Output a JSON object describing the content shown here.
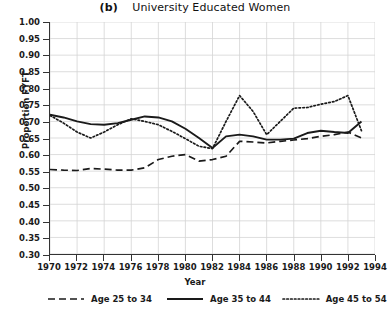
{
  "chart_data": {
    "type": "line",
    "panel_tag": "(b)",
    "title_text": "University Educated Women",
    "xlabel": "Year",
    "ylabel": "Proportion FYFT",
    "grid": true,
    "legend_position": "bottom",
    "xlim": [
      1970,
      1994
    ],
    "ylim": [
      0.3,
      1.0
    ],
    "ytick_labels": [
      "1.00",
      "0.95",
      "0.90",
      "0.85",
      "0.80",
      "0.75",
      "0.70",
      "0.65",
      "0.60",
      "0.55",
      "0.50",
      "0.45",
      "0.40",
      "0.35",
      "0.30"
    ],
    "ytick_values": [
      1.0,
      0.95,
      0.9,
      0.85,
      0.8,
      0.75,
      0.7,
      0.65,
      0.6,
      0.55,
      0.5,
      0.45,
      0.4,
      0.35,
      0.3
    ],
    "xtick_labels": [
      "1970",
      "1972",
      "1974",
      "1976",
      "1978",
      "1980",
      "1982",
      "1984",
      "1986",
      "1988",
      "1990",
      "1992",
      "1994"
    ],
    "xtick_values": [
      1970,
      1972,
      1974,
      1976,
      1978,
      1980,
      1982,
      1984,
      1986,
      1988,
      1990,
      1992,
      1994
    ],
    "x": [
      1970,
      1971,
      1972,
      1973,
      1974,
      1975,
      1976,
      1977,
      1978,
      1979,
      1980,
      1981,
      1982,
      1983,
      1984,
      1985,
      1986,
      1987,
      1988,
      1989,
      1990,
      1991,
      1992,
      1993
    ],
    "series": [
      {
        "name": "Age 25 to 34",
        "style": "dashed",
        "color": "#1a1a1a",
        "values": [
          0.555,
          0.553,
          0.552,
          0.558,
          0.556,
          0.553,
          0.553,
          0.56,
          0.585,
          0.595,
          0.6,
          0.58,
          0.585,
          0.595,
          0.64,
          0.638,
          0.635,
          0.64,
          0.644,
          0.648,
          0.655,
          0.66,
          0.668,
          0.65
        ]
      },
      {
        "name": "Age 35 to 44",
        "style": "solid",
        "color": "#1a1a1a",
        "values": [
          0.72,
          0.712,
          0.7,
          0.692,
          0.69,
          0.695,
          0.705,
          0.715,
          0.712,
          0.7,
          0.678,
          0.65,
          0.62,
          0.655,
          0.66,
          0.655,
          0.645,
          0.645,
          0.648,
          0.665,
          0.672,
          0.668,
          0.665,
          0.7
        ]
      },
      {
        "name": "Age 45 to 54",
        "style": "dotted",
        "color": "#1a1a1a",
        "values": [
          0.718,
          0.695,
          0.668,
          0.65,
          0.668,
          0.69,
          0.708,
          0.7,
          0.69,
          0.67,
          0.648,
          0.625,
          0.618,
          0.7,
          0.778,
          0.73,
          0.66,
          0.7,
          0.74,
          0.742,
          0.752,
          0.76,
          0.778,
          0.672
        ]
      }
    ]
  },
  "legend": {
    "entries": [
      {
        "label": "Age 25 to 34",
        "style": "dashed"
      },
      {
        "label": "Age 35 to 44",
        "style": "solid"
      },
      {
        "label": "Age 45 to 54",
        "style": "dotted"
      }
    ]
  }
}
